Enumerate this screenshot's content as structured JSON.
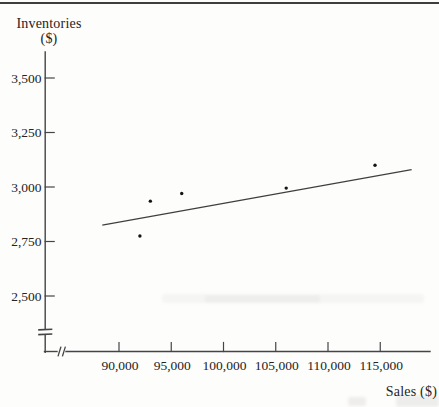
{
  "figure": {
    "y_axis_title_line1": "Inventories",
    "y_axis_title_line2": "($)",
    "x_axis_title": "Sales ($)"
  },
  "chart_data": {
    "type": "scatter",
    "title": "",
    "xlabel": "Sales ($)",
    "ylabel": "Inventories ($)",
    "grid": false,
    "legend": "none",
    "axis_breaks": {
      "x_axis": true,
      "y_axis": true
    },
    "xlim": [
      88000,
      118500
    ],
    "ylim": [
      2400,
      3600
    ],
    "x_ticks": [
      {
        "value": 90000,
        "label": "90,000"
      },
      {
        "value": 95000,
        "label": "95,000"
      },
      {
        "value": 100000,
        "label": "100,000"
      },
      {
        "value": 105000,
        "label": "105,000"
      },
      {
        "value": 110000,
        "label": "110,000"
      },
      {
        "value": 115000,
        "label": "115,000"
      }
    ],
    "y_ticks": [
      {
        "value": 2500,
        "label": "2,500"
      },
      {
        "value": 2750,
        "label": "2,750"
      },
      {
        "value": 3000,
        "label": "3,000"
      },
      {
        "value": 3250,
        "label": "3,250"
      },
      {
        "value": 3500,
        "label": "3,500"
      }
    ],
    "points": [
      {
        "sales": 92000,
        "inventories": 2775
      },
      {
        "sales": 93000,
        "inventories": 2935
      },
      {
        "sales": 96000,
        "inventories": 2970
      },
      {
        "sales": 106000,
        "inventories": 2995
      },
      {
        "sales": 114500,
        "inventories": 3100
      }
    ],
    "trendline": {
      "x1": 88400,
      "y1": 2825,
      "x2": 118000,
      "y2": 3080
    },
    "colors": {
      "ink": "#242424",
      "axis": "#454545",
      "point": "#151515",
      "trendline": "#3f3f3f",
      "rule": "#3e3e3e"
    }
  }
}
